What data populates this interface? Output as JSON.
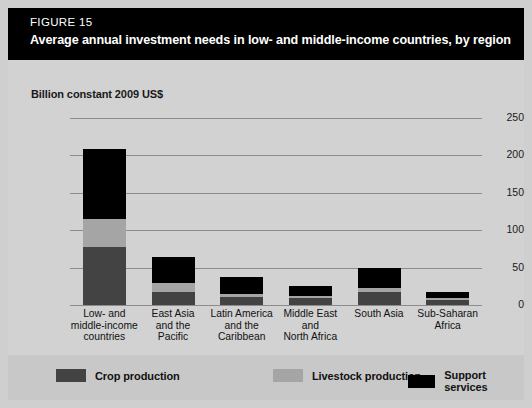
{
  "figure": {
    "number": "FIGURE 15",
    "title": "Average annual investment  needs in low- and middle-income countries, by region"
  },
  "colors": {
    "crop": "#434343",
    "livestock": "#a5a5a5",
    "support": "#000000",
    "panel_bg": "#d2d2d2",
    "legend_bg": "#c8c8c8",
    "title_bg": "#000000",
    "gridline": "#8c8c8c"
  },
  "legend": {
    "items": [
      {
        "label": "Crop production",
        "color": "#434343"
      },
      {
        "label": "Livestock production",
        "color": "#a5a5a5"
      },
      {
        "label": "Support services",
        "color": "#000000"
      }
    ]
  },
  "chart_data": {
    "type": "bar",
    "subtype": "stacked",
    "title": "Average annual investment  needs in low- and middle-income countries, by region",
    "xlabel": "",
    "ylabel": "Billion constant 2009 US$",
    "ylim": [
      0,
      250
    ],
    "yticks": [
      0,
      50,
      100,
      150,
      200,
      250
    ],
    "ytick_labels": [
      "0",
      "50",
      "100",
      "150",
      "200",
      "250"
    ],
    "grid": true,
    "legend_position": "bottom",
    "categories": [
      "Low- and middle-income countries",
      "East Asia and the Pacific",
      "Latin America and the Caribbean",
      "Middle East and North Africa",
      "South Asia",
      "Sub-Saharan Africa"
    ],
    "category_lines": [
      [
        "Low- and",
        "middle-income",
        "countries"
      ],
      [
        "East Asia",
        "and the",
        "Pacific"
      ],
      [
        "Latin America",
        "and the",
        "Caribbean"
      ],
      [
        "Middle East",
        "and",
        "North Africa"
      ],
      [
        "South Asia"
      ],
      [
        "Sub-Saharan",
        "Africa"
      ]
    ],
    "series": [
      {
        "name": "Crop production",
        "color": "#434343",
        "values": [
          77,
          17,
          11,
          9,
          17,
          7
        ]
      },
      {
        "name": "Livestock production",
        "color": "#a5a5a5",
        "values": [
          38,
          12,
          4,
          3,
          6,
          3
        ]
      },
      {
        "name": "Support services",
        "color": "#000000",
        "values": [
          93,
          35,
          23,
          14,
          27,
          8
        ]
      }
    ],
    "totals": [
      208,
      64,
      38,
      26,
      50,
      18
    ]
  }
}
